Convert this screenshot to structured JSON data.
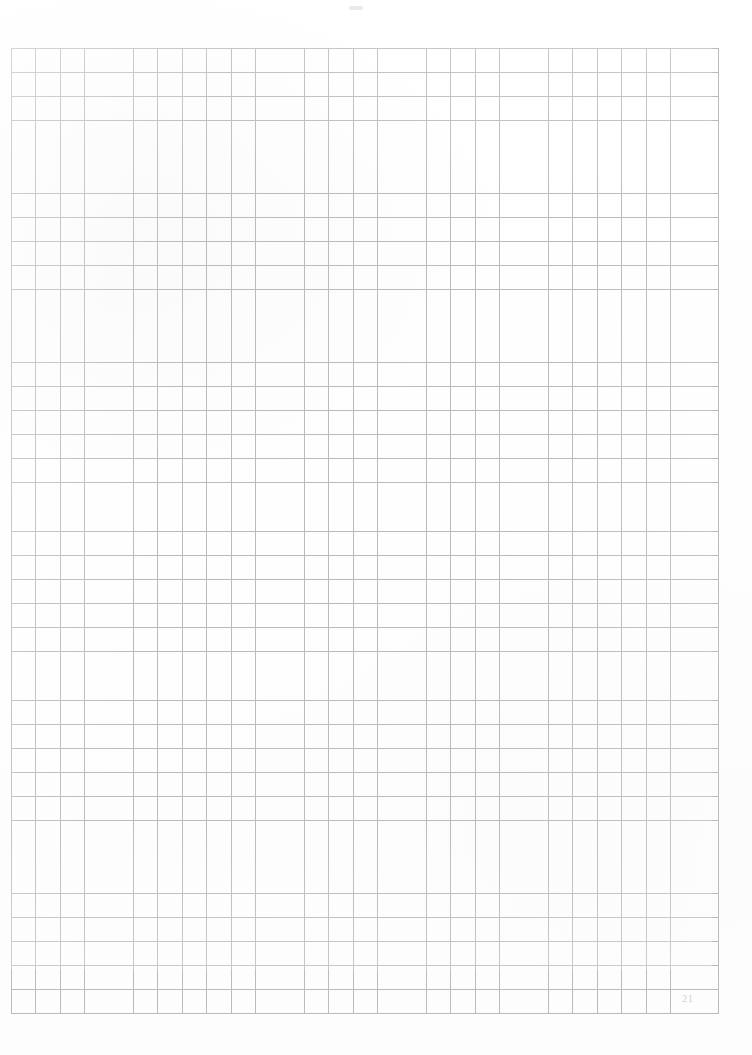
{
  "document": {
    "kind": "blank-squared-graph-paper-page",
    "page_number": "21",
    "background_color": "#ffffff"
  },
  "grid": {
    "line_color": "#b9bbbd",
    "columns": 29,
    "rows": 40,
    "cell_width_px": 24.4,
    "cell_height_px": 24.1,
    "origin_x_px": 11,
    "origin_y_px": 48,
    "width_px": 708,
    "height_px": 965
  },
  "marks": {
    "top_smudge_color": "#cdd0d4"
  },
  "content": {
    "body_text": "",
    "notes": ""
  }
}
